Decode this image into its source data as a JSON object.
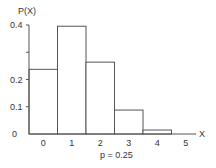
{
  "chart_data": {
    "type": "bar",
    "title": "",
    "xlabel": "X",
    "ylabel": "P(X)",
    "annotation": "p = 0.25",
    "categories": [
      "0",
      "1",
      "2",
      "3",
      "4",
      "5"
    ],
    "values": [
      0.2373,
      0.3955,
      0.2637,
      0.0879,
      0.0146,
      0.001
    ],
    "ylim": [
      0,
      0.4
    ],
    "yticks": [
      0,
      0.1,
      0.2,
      0.4
    ],
    "ytick_labels": [
      "0",
      "0.1",
      "0.2",
      "0.4"
    ],
    "xtick_labels": [
      "0",
      "1",
      "2",
      "3",
      "4",
      "5"
    ],
    "grid": false,
    "legend": null,
    "colors": {
      "bar_fill": "#ffffff",
      "bar_stroke": "#555555",
      "axis": "#555555"
    }
  }
}
